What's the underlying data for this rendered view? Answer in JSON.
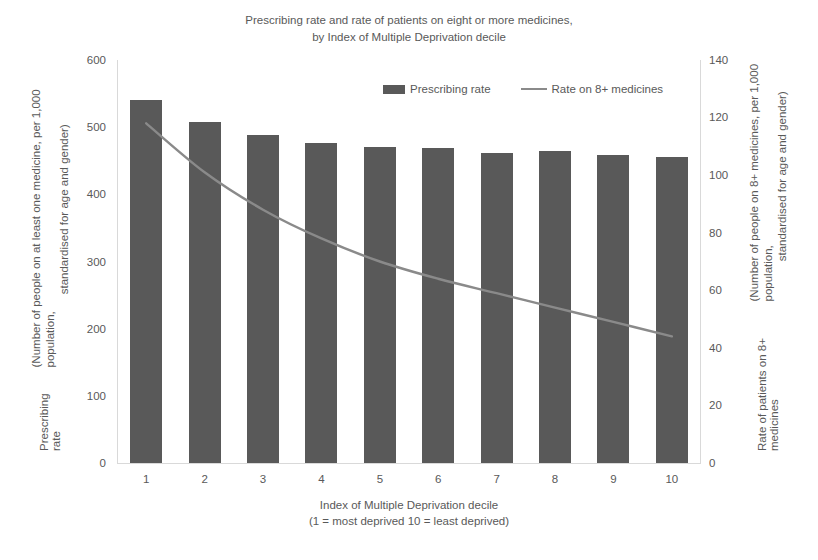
{
  "chart_data": {
    "type": "bar",
    "title": "Prescribing rate and rate of patients on eight or more medicines, by Index of Multiple Deprivation decile",
    "title_line1": "Prescribing rate and rate of patients on eight or more medicines,",
    "title_line2": "by Index of Multiple Deprivation decile",
    "categories": [
      "1",
      "2",
      "3",
      "4",
      "5",
      "6",
      "7",
      "8",
      "9",
      "10"
    ],
    "series": [
      {
        "name": "Prescribing rate",
        "type": "bar",
        "axis": "left",
        "color": "#595959",
        "values": [
          540,
          507,
          488,
          477,
          470,
          469,
          462,
          464,
          459,
          456
        ]
      },
      {
        "name": "Rate on 8+ medicines",
        "type": "line",
        "axis": "right",
        "color": "#8a8a8a",
        "values": [
          118,
          101,
          88,
          78,
          70,
          64,
          59,
          54,
          49,
          44
        ]
      }
    ],
    "xlabel": "Index of Multiple Deprivation decile",
    "xlabel_note": "(1 = most deprived 10 = least deprived)",
    "ylabel_left": "Prescribing rate",
    "ylabel_left_note_line1": "(Number of people on at least one medicine, per 1,000 population,",
    "ylabel_left_note_line2": "standardised for age and gender)",
    "ylabel_right": "Rate of patients on 8+ medicines",
    "ylabel_right_note_line1": "(Number of people on 8+ medicines, per 1,000 population,",
    "ylabel_right_note_line2": "standardised for age and gender)",
    "ylim_left": [
      0,
      600
    ],
    "ylim_right": [
      0,
      140
    ],
    "yticks_left": [
      "0",
      "100",
      "200",
      "300",
      "400",
      "500",
      "600"
    ],
    "yticks_right": [
      "0",
      "20",
      "40",
      "60",
      "80",
      "100",
      "120",
      "140"
    ],
    "grid": false,
    "legend_position": "top-center"
  },
  "legend": {
    "items": [
      {
        "label": "Prescribing rate",
        "marker": "bar-swatch",
        "color": "#595959"
      },
      {
        "label": "Rate on 8+ medicines",
        "marker": "line-swatch",
        "color": "#8a8a8a"
      }
    ]
  }
}
